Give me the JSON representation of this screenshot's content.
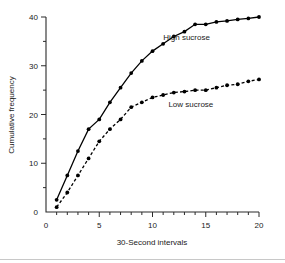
{
  "chart_data": {
    "type": "line",
    "title": "",
    "xlabel": "30-Second intervals",
    "ylabel": "Cumulative frequency",
    "xlim": [
      0,
      20
    ],
    "ylim": [
      0,
      40
    ],
    "grid": false,
    "legend_position": "inline-annotation",
    "x_major_ticks": [
      0,
      5,
      10,
      15,
      20
    ],
    "x_major_tick_labels": [
      "0",
      "5",
      "10",
      "15",
      "20"
    ],
    "x_minor_ticks": [
      1,
      2,
      3,
      4,
      6,
      7,
      8,
      9,
      11,
      12,
      13,
      14,
      16,
      17,
      18,
      19
    ],
    "y_major_ticks": [
      0,
      10,
      20,
      30,
      40
    ],
    "y_major_tick_labels": [
      "0",
      "10",
      "20",
      "30",
      "40"
    ],
    "y_minor_ticks": [
      5,
      15,
      25,
      35
    ],
    "x": [
      1,
      2,
      3,
      4,
      5,
      6,
      7,
      8,
      9,
      10,
      11,
      12,
      13,
      14,
      15,
      16,
      17,
      18,
      19,
      20
    ],
    "series": [
      {
        "name": "High sucrose",
        "style": "solid",
        "marker": "filled-circle",
        "label_x": 13.2,
        "label_y": 35.2,
        "values": [
          2.5,
          7.5,
          12.5,
          17.0,
          19.0,
          22.5,
          25.5,
          28.5,
          31.0,
          33.0,
          34.5,
          36.0,
          37.0,
          38.5,
          38.5,
          39.0,
          39.2,
          39.5,
          39.7,
          40.0
        ]
      },
      {
        "name": "Low sucrose",
        "style": "dashed",
        "marker": "filled-circle",
        "label_x": 13.6,
        "label_y": 21.5,
        "values": [
          1.0,
          4.0,
          7.5,
          11.0,
          14.5,
          17.0,
          19.0,
          21.5,
          22.5,
          23.5,
          24.0,
          24.5,
          24.7,
          25.0,
          25.0,
          25.5,
          26.0,
          26.2,
          26.8,
          27.2
        ]
      }
    ]
  },
  "colors": {
    "line": "#000000",
    "axis": "#2b2b2b",
    "text": "#1a1a1a",
    "background": "#ffffff"
  }
}
